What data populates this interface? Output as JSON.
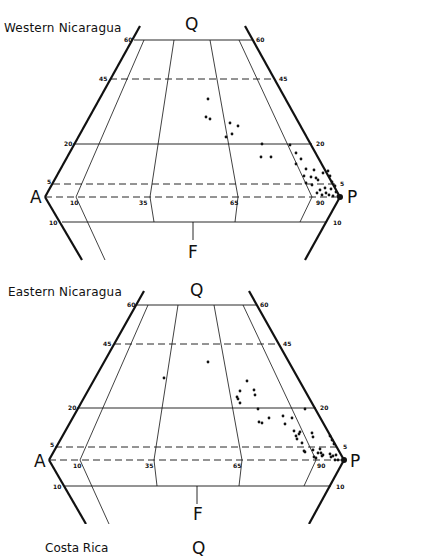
{
  "figure": {
    "type": "QAPF ternary/double-triangle classification diagram",
    "vertices": {
      "Q": "Q",
      "A": "A",
      "P": "P",
      "F": "F"
    },
    "panels": [
      {
        "title": "Western Nicaragua",
        "q_ticks": {
          "left": [
            "60",
            "45",
            "20",
            "5"
          ],
          "right": [
            "60",
            "45",
            "20",
            "5"
          ]
        },
        "f_ticks": {
          "left": "10",
          "right": "10"
        },
        "ratio_ticks": [
          "10",
          "35",
          "65",
          "90"
        ],
        "points": [
          [
            208,
            99
          ],
          [
            206,
            117
          ],
          [
            210,
            119
          ],
          [
            230,
            123
          ],
          [
            226,
            137
          ],
          [
            232,
            134
          ],
          [
            238,
            126
          ],
          [
            262,
            144
          ],
          [
            261,
            157
          ],
          [
            271,
            157
          ],
          [
            290,
            145
          ],
          [
            296,
            153
          ],
          [
            301,
            159
          ],
          [
            296,
            164
          ],
          [
            306,
            169
          ],
          [
            304,
            176
          ],
          [
            311,
            177
          ],
          [
            314,
            170
          ],
          [
            316,
            178
          ],
          [
            306,
            183
          ],
          [
            312,
            185
          ],
          [
            318,
            180
          ],
          [
            323,
            173
          ],
          [
            328,
            171
          ],
          [
            330,
            176
          ],
          [
            332,
            182
          ],
          [
            335,
            186
          ],
          [
            325,
            188
          ],
          [
            320,
            190
          ],
          [
            326,
            193
          ],
          [
            329,
            195
          ],
          [
            333,
            196
          ],
          [
            338,
            196
          ],
          [
            336,
            192
          ],
          [
            331,
            189
          ],
          [
            322,
            195
          ],
          [
            317,
            193
          ]
        ]
      },
      {
        "title": "Eastern Nicaragua",
        "q_ticks": {
          "left": [
            "60",
            "45",
            "20",
            "5"
          ],
          "right": [
            "60",
            "45",
            "20",
            "5"
          ]
        },
        "f_ticks": {
          "left": "10",
          "right": "10"
        },
        "ratio_ticks": [
          "10",
          "35",
          "65",
          "90"
        ],
        "points": [
          [
            164,
            378
          ],
          [
            208,
            362
          ],
          [
            247,
            381
          ],
          [
            240,
            391
          ],
          [
            254,
            390
          ],
          [
            255,
            395
          ],
          [
            237,
            397
          ],
          [
            240,
            403
          ],
          [
            238,
            399
          ],
          [
            258,
            409
          ],
          [
            269,
            418
          ],
          [
            259,
            422
          ],
          [
            262,
            423
          ],
          [
            285,
            424
          ],
          [
            283,
            416
          ],
          [
            292,
            418
          ],
          [
            305,
            409
          ],
          [
            294,
            431
          ],
          [
            296,
            436
          ],
          [
            297,
            439
          ],
          [
            299,
            434
          ],
          [
            300,
            432
          ],
          [
            302,
            443
          ],
          [
            312,
            433
          ],
          [
            313,
            437
          ],
          [
            305,
            452
          ],
          [
            304,
            451
          ],
          [
            313,
            450
          ],
          [
            320,
            449
          ],
          [
            318,
            453
          ],
          [
            321,
            453
          ],
          [
            323,
            455
          ],
          [
            322,
            456
          ],
          [
            330,
            454
          ],
          [
            331,
            457
          ],
          [
            333,
            456
          ],
          [
            336,
            455
          ],
          [
            334,
            444
          ],
          [
            332,
            440
          ],
          [
            330,
            436
          ],
          [
            314,
            457
          ],
          [
            316,
            458
          ],
          [
            335,
            460
          ],
          [
            338,
            460
          ]
        ]
      }
    ],
    "partial_panel": {
      "title": "Costa Rica",
      "q_label": "Q"
    }
  }
}
